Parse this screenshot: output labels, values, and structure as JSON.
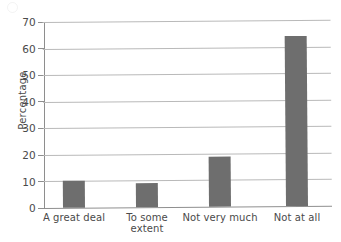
{
  "chart_data": {
    "type": "bar",
    "title": "",
    "xlabel": "",
    "ylabel": "Percentage",
    "categories": [
      "A great deal",
      "To some extent",
      "Not very much",
      "Not at all"
    ],
    "category_lines": [
      [
        "A great deal"
      ],
      [
        "To some",
        "extent"
      ],
      [
        "Not very much"
      ],
      [
        "Not at all"
      ]
    ],
    "values": [
      10,
      9,
      19,
      64
    ],
    "ylim": [
      0,
      70
    ],
    "ytick_step": 10,
    "yticks": [
      "0",
      "10",
      "20",
      "30",
      "40",
      "50",
      "60",
      "70"
    ],
    "grid": true,
    "grid_axis": "y",
    "legend": "none",
    "bar_color": "#6e6e6e",
    "grid_color": "#b9b9b9",
    "axis_color": "#8e8e8e",
    "text_color": "#4a4a4a",
    "background": "#ffffff"
  }
}
